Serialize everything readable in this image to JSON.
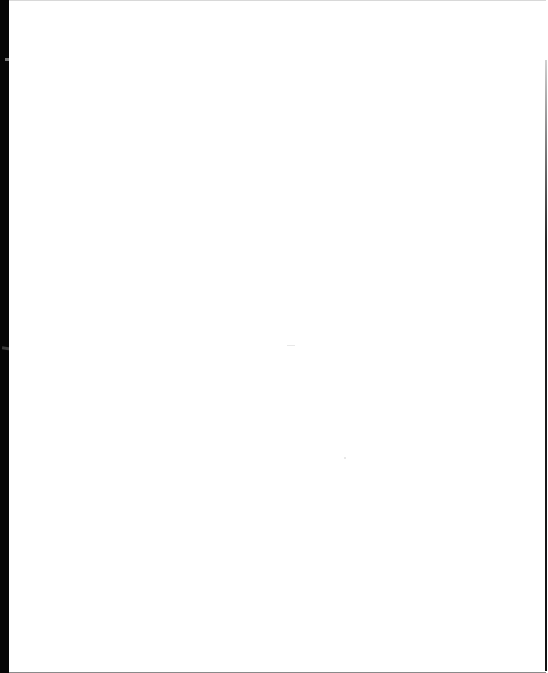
{
  "document": {
    "type": "scanned-page",
    "content": "",
    "background_color": "#ffffff",
    "scan_edge_color": "#050505"
  }
}
